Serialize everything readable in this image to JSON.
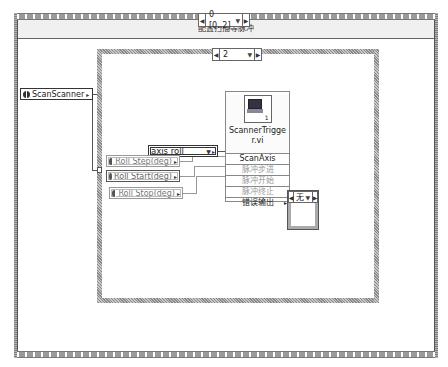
{
  "outer_structure": {
    "type": "stacked-sequence",
    "selector": "0 [0..2]",
    "frame_label": "配置扫描等脉冲"
  },
  "inner_case": {
    "selector": "2"
  },
  "constants": {
    "scan_scanner": "ScanScanner",
    "axis_enum": "axis roll",
    "roll_step": "Roll Step(deg)",
    "roll_start": "Roll Start(deg)",
    "roll_stop": "Roll Stop(deg)"
  },
  "subvi": {
    "title_line1": "ScannerTrigge",
    "title_line2": "r.vi",
    "icon_badge": "1",
    "terminals": [
      {
        "label": "ScanAxis",
        "wired": true
      },
      {
        "label": "脉冲步进",
        "wired": false
      },
      {
        "label": "脉冲开始",
        "wired": false
      },
      {
        "label": "脉冲终止",
        "wired": false
      },
      {
        "label": "错误输出",
        "wired": true
      }
    ]
  },
  "error_indicator": {
    "value": "无"
  },
  "glyphs": {
    "left_arrow": "◀",
    "right_arrow": "▶",
    "drop": "▼",
    "out_tri": "▸"
  }
}
